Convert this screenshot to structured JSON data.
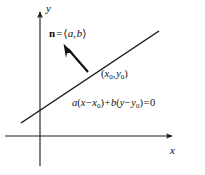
{
  "figure": {
    "type": "math-diagram",
    "background_color": "#ffffff",
    "stroke_color": "#1a1a1a",
    "axes": {
      "x_label": "x",
      "y_label": "y",
      "origin": {
        "x": 40,
        "y": 136
      },
      "x_axis": {
        "x1": 5,
        "y1": 136,
        "x2": 178,
        "y2": 136,
        "arrow": "right"
      },
      "y_axis": {
        "x1": 40,
        "y1": 166,
        "x2": 40,
        "y2": 8,
        "arrow": "up"
      }
    },
    "line": {
      "name": "plotted-line",
      "x1": 21,
      "y1": 123,
      "x2": 159,
      "y2": 31
    },
    "normal_vector": {
      "name": "normal-vector-arrow",
      "tail": {
        "x": 88,
        "y": 72
      },
      "tip": {
        "x": 64,
        "y": 45
      },
      "label_n": "n",
      "label_eq": "=",
      "label_bracket_open": "⟨",
      "label_a": "a",
      "label_comma": ",",
      "label_b": "b",
      "label_bracket_close": "⟩"
    },
    "point_label": {
      "name": "point-x0-y0",
      "open_paren": "(",
      "x_var": "x",
      "x_sub": "0",
      "comma": ",",
      "y_var": "y",
      "y_sub": "0",
      "close_paren": ")"
    },
    "equation": {
      "name": "line-equation",
      "a": "a",
      "open1": "(",
      "x": "x",
      "minus1": "−",
      "x0": "x",
      "x0sub": "0",
      "close1": ")",
      "plus": "+",
      "b": "b",
      "open2": "(",
      "y": "y",
      "minus2": "−",
      "y0": "y",
      "y0sub": "0",
      "close2": ")",
      "equals": "=",
      "zero": "0"
    }
  }
}
